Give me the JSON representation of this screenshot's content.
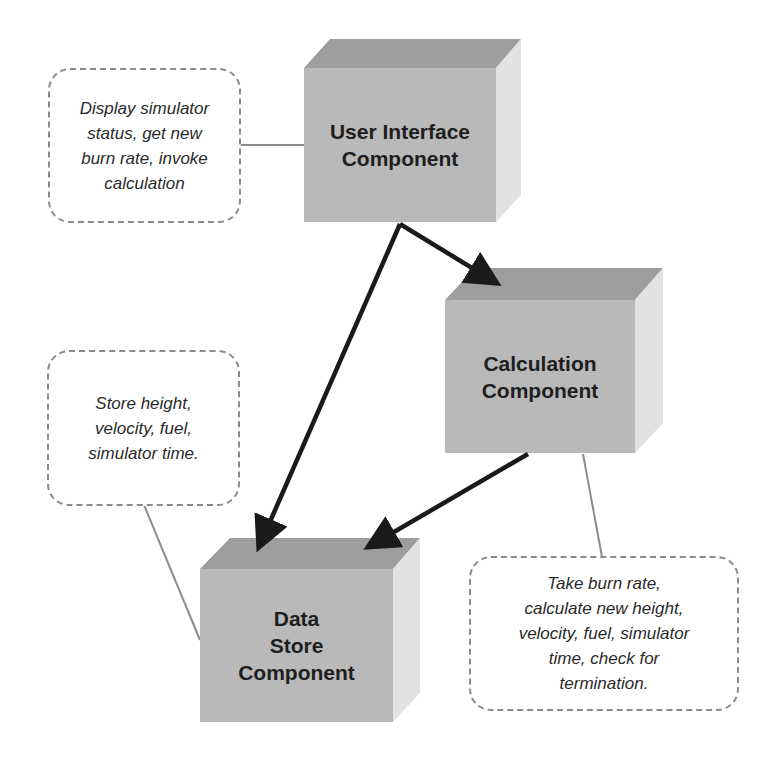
{
  "diagram": {
    "components": [
      {
        "id": "ui",
        "label": "User Interface\nComponent"
      },
      {
        "id": "calc",
        "label": "Calculation\nComponent"
      },
      {
        "id": "store",
        "label": "Data\nStore\nComponent"
      }
    ],
    "notes": [
      {
        "target": "ui",
        "text": "Display simulator\nstatus, get new\nburn rate, invoke\ncalculation"
      },
      {
        "target": "store",
        "text": "Store height,\nvelocity, fuel,\nsimulator time."
      },
      {
        "target": "calc",
        "text": "Take burn rate,\ncalculate new height,\nvelocity, fuel, simulator\ntime, check for\ntermination."
      }
    ],
    "arrows": [
      {
        "from": "ui",
        "to": "calc"
      },
      {
        "from": "ui",
        "to": "store"
      },
      {
        "from": "calc",
        "to": "store"
      }
    ],
    "colors": {
      "cube_front": "#b9b9b9",
      "cube_top": "#9d9d9d",
      "cube_side": "#e2e2e2",
      "arrow": "#1a1a1a",
      "note_border": "#8a8a8a",
      "connector": "#8c8c8c"
    }
  }
}
